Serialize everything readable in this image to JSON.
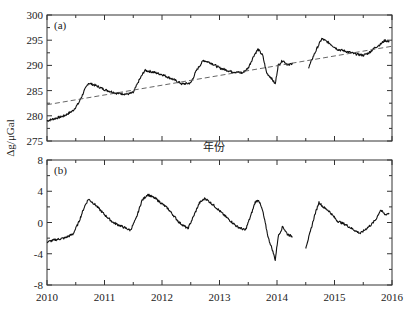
{
  "chart_data": [
    {
      "type": "line",
      "panel_label": "(a)",
      "xlabel": "年份",
      "ylabel": "Δg/μGal",
      "xlim": [
        2010,
        2016
      ],
      "ylim": [
        275,
        300
      ],
      "yticks": [
        275,
        280,
        285,
        290,
        295,
        300
      ],
      "xticks": [
        2010,
        2011,
        2012,
        2013,
        2014,
        2015,
        2016
      ],
      "grid": false,
      "series": [
        {
          "name": "observed gravity",
          "style": "solid",
          "segments": [
            {
              "x": [
                2010.0,
                2010.15,
                2010.3,
                2010.45,
                2010.55,
                2010.65,
                2010.72,
                2010.85,
                2011.0,
                2011.2,
                2011.4,
                2011.5,
                2011.6,
                2011.7,
                2011.8,
                2012.0,
                2012.2,
                2012.35,
                2012.5,
                2012.6,
                2012.72,
                2012.85,
                2013.0,
                2013.2,
                2013.4,
                2013.5,
                2013.6,
                2013.67,
                2013.75,
                2013.82,
                2013.9,
                2013.97,
                2014.02,
                2014.1,
                2014.2,
                2014.27
              ],
              "y": [
                279.0,
                279.5,
                280.0,
                281.0,
                282.5,
                285.0,
                286.5,
                286.0,
                285.2,
                284.5,
                284.3,
                284.6,
                287.0,
                289.0,
                288.8,
                288.2,
                287.2,
                286.3,
                286.5,
                289.0,
                291.0,
                290.5,
                289.5,
                288.8,
                288.5,
                289.5,
                292.0,
                293.2,
                292.0,
                288.5,
                287.5,
                286.3,
                290.0,
                291.0,
                290.0,
                290.5
              ]
            },
            {
              "x": [
                2014.55,
                2014.62,
                2014.7,
                2014.78,
                2014.9,
                2015.05,
                2015.2,
                2015.35,
                2015.5,
                2015.6,
                2015.7,
                2015.8,
                2015.88,
                2015.95
              ],
              "y": [
                289.5,
                291.5,
                293.5,
                295.3,
                294.5,
                293.2,
                292.8,
                292.3,
                292.0,
                292.5,
                293.5,
                294.2,
                295.0,
                294.6
              ]
            }
          ]
        },
        {
          "name": "linear trend",
          "style": "dashed",
          "x": [
            2010.0,
            2016.0
          ],
          "y": [
            282.2,
            293.8
          ]
        }
      ]
    },
    {
      "type": "line",
      "panel_label": "(b)",
      "xlabel": "",
      "ylabel": "Δg/μGal",
      "xlim": [
        2010,
        2016
      ],
      "ylim": [
        -8,
        8
      ],
      "yticks": [
        -8,
        -4,
        0,
        4,
        8
      ],
      "xticks": [
        2010,
        2011,
        2012,
        2013,
        2014,
        2015,
        2016
      ],
      "grid": false,
      "series": [
        {
          "name": "detrended residual",
          "style": "solid",
          "segments": [
            {
              "x": [
                2010.0,
                2010.15,
                2010.3,
                2010.45,
                2010.55,
                2010.65,
                2010.72,
                2010.85,
                2011.0,
                2011.15,
                2011.3,
                2011.45,
                2011.55,
                2011.65,
                2011.75,
                2011.9,
                2012.1,
                2012.3,
                2012.45,
                2012.55,
                2012.65,
                2012.75,
                2012.9,
                2013.1,
                2013.3,
                2013.45,
                2013.55,
                2013.62,
                2013.68,
                2013.75,
                2013.85,
                2013.92,
                2013.97,
                2014.02,
                2014.1,
                2014.18,
                2014.27
              ],
              "y": [
                -2.5,
                -2.2,
                -2.0,
                -1.5,
                0.0,
                2.0,
                3.0,
                2.2,
                1.0,
                0.0,
                -0.5,
                -1.0,
                0.5,
                2.8,
                3.6,
                3.0,
                1.8,
                0.0,
                -0.8,
                0.8,
                2.5,
                3.1,
                2.2,
                0.8,
                -0.5,
                -1.0,
                1.0,
                2.6,
                2.9,
                1.5,
                -2.0,
                -3.5,
                -4.8,
                -1.8,
                -0.5,
                -1.5,
                -1.8
              ]
            },
            {
              "x": [
                2014.5,
                2014.58,
                2014.65,
                2014.73,
                2014.8,
                2014.9,
                2015.05,
                2015.2,
                2015.35,
                2015.45,
                2015.55,
                2015.65,
                2015.72,
                2015.8,
                2015.88,
                2015.95
              ],
              "y": [
                -3.2,
                -1.2,
                0.8,
                2.6,
                2.0,
                1.5,
                0.2,
                -0.3,
                -1.0,
                -1.4,
                -0.8,
                -0.2,
                0.4,
                1.6,
                1.0,
                1.2
              ]
            }
          ]
        }
      ]
    }
  ],
  "labels": {
    "panel_a": "(a)",
    "panel_b": "(b)",
    "xlabel": "年份",
    "ylabel": "Δg/μGal"
  }
}
